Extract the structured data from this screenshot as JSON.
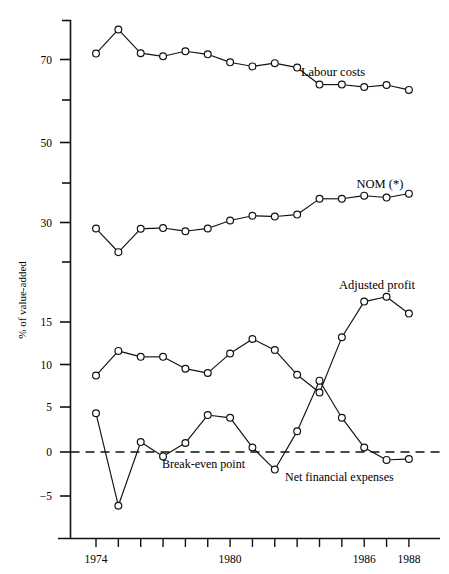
{
  "chart_data": {
    "type": "line",
    "title": "",
    "xlabel": "",
    "ylabel": "% of value-added",
    "x": [
      1974,
      1975,
      1976,
      1977,
      1978,
      1979,
      1980,
      1981,
      1982,
      1983,
      1984,
      1985,
      1986,
      1987,
      1988
    ],
    "xlim": [
      1973.2,
      1988.8
    ],
    "ylim": [
      -7.5,
      80
    ],
    "grid": false,
    "legend": "inline-right",
    "y_axis_note": "broken scale: upper ticks every 10 units (70,60,50,40,30,20), lower ticks every 5 units (15,10,5,0,-5)",
    "y_ticks_labeled": [
      70,
      50,
      30,
      15,
      10,
      5,
      0,
      -5
    ],
    "y_ticks_unlabeled": [
      60,
      40,
      20
    ],
    "x_ticks_labeled": [
      1974,
      1980,
      1986,
      1988
    ],
    "x_ticks_all": [
      1974,
      1975,
      1976,
      1977,
      1978,
      1979,
      1980,
      1981,
      1982,
      1983,
      1984,
      1985,
      1986,
      1987,
      1988
    ],
    "zero_reference_line": 0,
    "zero_reference_style": "dashed",
    "marker": "open-circle",
    "series": [
      {
        "name": "Labour costs",
        "label": "Labour costs",
        "values": [
          71.5,
          77.6,
          71.6,
          70.8,
          72.1,
          71.3,
          69.3,
          68.3,
          69.1,
          68.0,
          63.8,
          63.8,
          63.2,
          63.7,
          62.5
        ]
      },
      {
        "name": "NOM (*)",
        "label": "NOM (*)",
        "values": [
          28.5,
          22.5,
          28.4,
          28.6,
          27.8,
          28.5,
          30.5,
          31.7,
          31.5,
          32.0,
          36.0,
          36.0,
          36.8,
          36.3,
          37.3
        ]
      },
      {
        "name": "Adjusted profit",
        "label": "Adjusted profit",
        "values": [
          8.7,
          11.6,
          10.9,
          10.9,
          9.5,
          9.0,
          11.3,
          13.0,
          11.7,
          8.8,
          6.7,
          13.2,
          16.7,
          17.1,
          15.7
        ]
      },
      {
        "name": "Net financial expenses",
        "label": "Net financial expenses",
        "values": [
          4.3,
          -6.1,
          1.1,
          -0.5,
          1.0,
          4.1,
          3.8,
          0.5,
          -2.0,
          2.3,
          8.1,
          3.8,
          0.5,
          -0.9,
          -0.8
        ]
      }
    ],
    "annotations": [
      {
        "text": "Break-even point",
        "ref": "zero-line"
      }
    ]
  },
  "labels": {
    "ylabel": "% of value-added",
    "labour_costs": "Labour costs",
    "nom": "NOM (*)",
    "adjusted_profit": "Adjusted profit",
    "break_even": "Break-even point",
    "net_financial_expenses": "Net financial expenses",
    "y70": "70",
    "y50": "50",
    "y30": "30",
    "y15": "15",
    "y10": "10",
    "y5": "5",
    "y0": "0",
    "ym5": "−5",
    "x1974": "1974",
    "x1980": "1980",
    "x1986": "1986",
    "x1988": "1988"
  },
  "colors": {
    "ink": "#111111",
    "marker_fill": "#ffffff",
    "background": "#ffffff"
  }
}
